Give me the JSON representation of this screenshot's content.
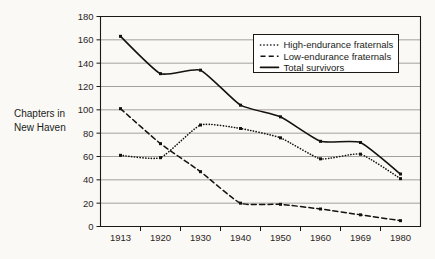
{
  "chart_data": {
    "type": "line",
    "title": "",
    "subtitle": "",
    "xlabel": "",
    "ylabel": "Chapters in New Haven",
    "ylabel_line1": "Chapters in",
    "ylabel_line2": "New Haven",
    "categories": [
      "1913",
      "1920",
      "1930",
      "1940",
      "1950",
      "1960",
      "1969",
      "1980"
    ],
    "ylim": [
      0,
      180
    ],
    "ytick_step": 20,
    "yticks": [
      "0",
      "20",
      "40",
      "60",
      "80",
      "100",
      "120",
      "140",
      "160",
      "180"
    ],
    "grid": "horizontal",
    "legend_position": "top-right-inside",
    "smoothing": "spline",
    "series": [
      {
        "name": "High-endurance fraternals",
        "style": "dotted",
        "values": [
          61,
          59,
          87,
          84,
          76,
          58,
          62,
          41
        ]
      },
      {
        "name": "Low-endurance fraternals",
        "style": "dashed",
        "values": [
          101,
          71,
          47,
          20,
          19,
          15,
          10,
          5
        ]
      },
      {
        "name": "Total survivors",
        "style": "solid",
        "values": [
          163,
          131,
          134,
          104,
          94,
          73,
          72,
          45
        ]
      }
    ],
    "colors": {
      "line": "#14110e",
      "grid": "#8d8a85",
      "axis": "#1c1814",
      "background": "#fbf9f6",
      "legend_background": "#ffffff"
    }
  },
  "legend": {
    "items": [
      {
        "label": "High-endurance fraternals",
        "style": "dotted"
      },
      {
        "label": "Low-endurance fraternals",
        "style": "dashed"
      },
      {
        "label": "Total survivors",
        "style": "solid"
      }
    ]
  }
}
